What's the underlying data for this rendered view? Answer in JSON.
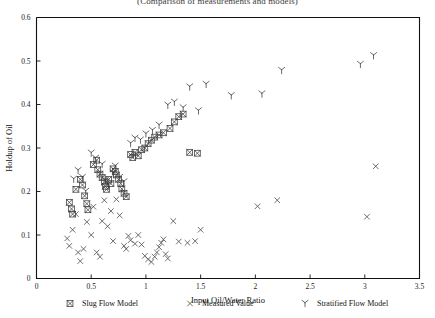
{
  "chart_data": {
    "type": "scatter",
    "title": "(Comparison of measurements and models)",
    "xlabel": "Input Oil/Water Ratio",
    "ylabel": "Holdup of Oil",
    "xlim": [
      0,
      3.5
    ],
    "ylim": [
      0,
      0.6
    ],
    "xticks": [
      0,
      0.5,
      1,
      1.5,
      2,
      2.5,
      3,
      3.5
    ],
    "xticklabels": [
      "0",
      "0.5",
      "1",
      "1.5",
      "2",
      "2.5",
      "3",
      "3.5"
    ],
    "yticks": [
      0,
      0.1,
      0.2,
      0.3,
      0.4,
      0.5,
      0.6
    ],
    "yticklabels": [
      "0",
      "0.1",
      "0.2",
      "0.3",
      "0.4",
      "0.5",
      "0.6"
    ],
    "grid": false,
    "legend_position": "below",
    "series": [
      {
        "name": "Slug Flow Model",
        "marker": "square-x",
        "color": "#3b3b3b",
        "points": [
          [
            0.3,
            0.175
          ],
          [
            0.32,
            0.16
          ],
          [
            0.33,
            0.148
          ],
          [
            0.36,
            0.205
          ],
          [
            0.4,
            0.228
          ],
          [
            0.42,
            0.215
          ],
          [
            0.44,
            0.19
          ],
          [
            0.46,
            0.172
          ],
          [
            0.47,
            0.158
          ],
          [
            0.52,
            0.262
          ],
          [
            0.55,
            0.272
          ],
          [
            0.56,
            0.25
          ],
          [
            0.58,
            0.24
          ],
          [
            0.6,
            0.232
          ],
          [
            0.62,
            0.222
          ],
          [
            0.63,
            0.212
          ],
          [
            0.64,
            0.205
          ],
          [
            0.66,
            0.228
          ],
          [
            0.68,
            0.218
          ],
          [
            0.7,
            0.252
          ],
          [
            0.72,
            0.246
          ],
          [
            0.73,
            0.238
          ],
          [
            0.75,
            0.228
          ],
          [
            0.77,
            0.218
          ],
          [
            0.78,
            0.206
          ],
          [
            0.8,
            0.196
          ],
          [
            0.82,
            0.188
          ],
          [
            0.86,
            0.285
          ],
          [
            0.88,
            0.278
          ],
          [
            0.9,
            0.29
          ],
          [
            0.93,
            0.282
          ],
          [
            0.96,
            0.296
          ],
          [
            0.99,
            0.3
          ],
          [
            1.02,
            0.31
          ],
          [
            1.05,
            0.318
          ],
          [
            1.08,
            0.325
          ],
          [
            1.12,
            0.33
          ],
          [
            1.16,
            0.335
          ],
          [
            1.22,
            0.345
          ],
          [
            1.26,
            0.36
          ],
          [
            1.3,
            0.372
          ],
          [
            1.34,
            0.378
          ],
          [
            1.4,
            0.29
          ],
          [
            1.47,
            0.288
          ]
        ]
      },
      {
        "name": "Measured Value",
        "marker": "x",
        "color": "#4a4a4a",
        "points": [
          [
            0.28,
            0.092
          ],
          [
            0.3,
            0.075
          ],
          [
            0.33,
            0.112
          ],
          [
            0.36,
            0.148
          ],
          [
            0.38,
            0.06
          ],
          [
            0.4,
            0.04
          ],
          [
            0.43,
            0.068
          ],
          [
            0.46,
            0.13
          ],
          [
            0.5,
            0.1
          ],
          [
            0.52,
            0.165
          ],
          [
            0.55,
            0.06
          ],
          [
            0.58,
            0.05
          ],
          [
            0.6,
            0.132
          ],
          [
            0.62,
            0.18
          ],
          [
            0.65,
            0.12
          ],
          [
            0.68,
            0.155
          ],
          [
            0.7,
            0.086
          ],
          [
            0.73,
            0.182
          ],
          [
            0.76,
            0.145
          ],
          [
            0.8,
            0.075
          ],
          [
            0.82,
            0.068
          ],
          [
            0.84,
            0.098
          ],
          [
            0.86,
            0.088
          ],
          [
            0.9,
            0.08
          ],
          [
            0.93,
            0.1
          ],
          [
            0.96,
            0.078
          ],
          [
            0.99,
            0.052
          ],
          [
            1.02,
            0.044
          ],
          [
            1.05,
            0.038
          ],
          [
            1.08,
            0.05
          ],
          [
            1.1,
            0.06
          ],
          [
            1.12,
            0.072
          ],
          [
            1.14,
            0.082
          ],
          [
            1.16,
            0.09
          ],
          [
            1.18,
            0.056
          ],
          [
            1.2,
            0.046
          ],
          [
            1.25,
            0.132
          ],
          [
            1.3,
            0.085
          ],
          [
            1.38,
            0.082
          ],
          [
            1.45,
            0.086
          ],
          [
            1.5,
            0.112
          ],
          [
            2.02,
            0.166
          ],
          [
            2.2,
            0.18
          ],
          [
            3.02,
            0.142
          ],
          [
            3.1,
            0.258
          ]
        ]
      },
      {
        "name": "Stratified Flow Model",
        "marker": "lambda",
        "color": "#3b3b3b",
        "points": [
          [
            0.34,
            0.228
          ],
          [
            0.38,
            0.248
          ],
          [
            0.42,
            0.232
          ],
          [
            0.45,
            0.2
          ],
          [
            0.5,
            0.288
          ],
          [
            0.54,
            0.276
          ],
          [
            0.6,
            0.262
          ],
          [
            0.63,
            0.225
          ],
          [
            0.66,
            0.216
          ],
          [
            0.7,
            0.242
          ],
          [
            0.72,
            0.258
          ],
          [
            0.76,
            0.232
          ],
          [
            0.8,
            0.222
          ],
          [
            0.86,
            0.31
          ],
          [
            0.9,
            0.322
          ],
          [
            0.95,
            0.318
          ],
          [
            1.0,
            0.332
          ],
          [
            1.06,
            0.34
          ],
          [
            1.12,
            0.352
          ],
          [
            1.2,
            0.398
          ],
          [
            1.26,
            0.405
          ],
          [
            1.34,
            0.392
          ],
          [
            1.4,
            0.44
          ],
          [
            1.48,
            0.385
          ],
          [
            1.55,
            0.446
          ],
          [
            1.78,
            0.42
          ],
          [
            2.06,
            0.424
          ],
          [
            2.24,
            0.478
          ],
          [
            2.96,
            0.492
          ],
          [
            3.08,
            0.512
          ]
        ]
      }
    ]
  },
  "legend": {
    "entries": [
      {
        "label": "Slug Flow Model",
        "marker": "square-x"
      },
      {
        "label": "Measured Value",
        "marker": "x"
      },
      {
        "label": "Stratified Flow Model",
        "marker": "lambda"
      }
    ]
  }
}
